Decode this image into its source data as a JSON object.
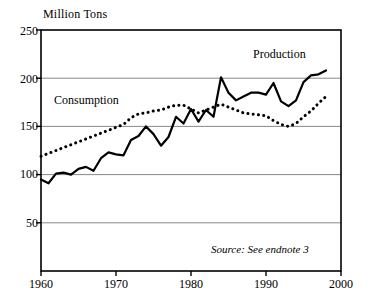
{
  "chart_data": {
    "type": "line",
    "title": "",
    "ylabel": "Million Tons",
    "xlabel": "",
    "xlim": [
      1960,
      2000
    ],
    "ylim": [
      0,
      250
    ],
    "yticks": [
      50,
      100,
      150,
      200,
      250
    ],
    "xticks": [
      1960,
      1970,
      1980,
      1990,
      2000
    ],
    "grid": "horizontal",
    "legend_position": "inline-annotations",
    "annotations": [
      "Source: See endnote 3"
    ],
    "x": [
      1960,
      1961,
      1962,
      1963,
      1964,
      1965,
      1966,
      1967,
      1968,
      1969,
      1970,
      1971,
      1972,
      1973,
      1974,
      1975,
      1976,
      1977,
      1978,
      1979,
      1980,
      1981,
      1982,
      1983,
      1984,
      1985,
      1986,
      1987,
      1988,
      1989,
      1990,
      1991,
      1992,
      1993,
      1994,
      1995,
      1996,
      1997,
      1998
    ],
    "series": [
      {
        "name": "Production",
        "style": "solid",
        "color": "#000000",
        "values": [
          95,
          91,
          101,
          102,
          100,
          106,
          108,
          104,
          117,
          123,
          121,
          120,
          136,
          140,
          150,
          142,
          130,
          139,
          160,
          153,
          168,
          155,
          167,
          160,
          201,
          185,
          177,
          181,
          185,
          185,
          183,
          195,
          176,
          171,
          177,
          196,
          203,
          204,
          208
        ]
      },
      {
        "name": "Consumption",
        "style": "dotted",
        "color": "#000000",
        "values": [
          119,
          122,
          125,
          128,
          131,
          134,
          137,
          140,
          143,
          146,
          149,
          152,
          159,
          163,
          164,
          166,
          167,
          170,
          172,
          172,
          168,
          164,
          167,
          170,
          173,
          170,
          167,
          164,
          163,
          162,
          161,
          156,
          152,
          150,
          153,
          160,
          166,
          174,
          181
        ]
      }
    ]
  },
  "axis": {
    "y_title": "Million Tons",
    "y_ticks": [
      "250",
      "200",
      "150",
      "100",
      "50"
    ],
    "x_ticks": [
      "1960",
      "1970",
      "1980",
      "1990",
      "2000"
    ]
  },
  "labels": {
    "production": "Production",
    "consumption": "Consumption",
    "source": "Source: See endnote 3"
  }
}
